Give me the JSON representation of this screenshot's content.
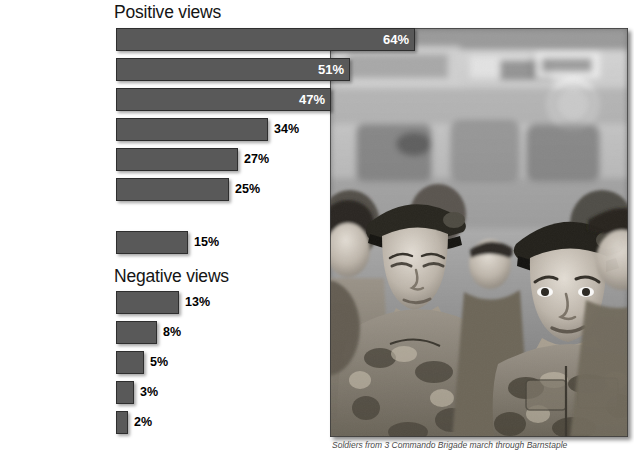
{
  "figure": {
    "background_color": "#ffffff",
    "bar_color": "#595959",
    "bar_border_color": "#2e2e2e",
    "label_color": "#000000",
    "inside_value_color": "#ffffff"
  },
  "sections": {
    "positive_title": "Positive views",
    "negative_title": "Negative views"
  },
  "caption": {
    "text": "Soldiers from 3 Commando Brigade march through Barnstaple"
  },
  "chart_data": {
    "type": "bar",
    "orientation": "horizontal",
    "title": "Positive views",
    "subtitle": "Negative views",
    "xlabel": "",
    "ylabel": "",
    "xlim": [
      0,
      70
    ],
    "grid": false,
    "legend": "none",
    "value_suffix": "%",
    "categories": [
      "Supportive",
      "Proud",
      "Respectful",
      "Sympathetic",
      "Grateful",
      "Admiring",
      "Indifferent",
      "Wary",
      "Intimidated",
      "Condescending",
      "Jealous",
      "Afraid"
    ],
    "values": [
      64,
      51,
      47,
      34,
      27,
      25,
      15,
      13,
      8,
      5,
      3,
      2
    ],
    "groups": [
      {
        "name": "Positive views",
        "categories": [
          "Supportive",
          "Proud",
          "Respectful",
          "Sympathetic",
          "Grateful",
          "Admiring"
        ],
        "values": [
          64,
          51,
          47,
          34,
          27,
          25
        ]
      },
      {
        "name": "Neutral",
        "categories": [
          "Indifferent"
        ],
        "values": [
          15
        ]
      },
      {
        "name": "Negative views",
        "categories": [
          "Wary",
          "Intimidated",
          "Condescending",
          "Jealous",
          "Afraid"
        ],
        "values": [
          13,
          8,
          5,
          3,
          2
        ]
      }
    ]
  },
  "rows": [
    {
      "label": "Supportive",
      "value": 64,
      "value_text": "64%",
      "top": 28,
      "width": 299,
      "value_inside": true
    },
    {
      "label": "Proud",
      "value": 51,
      "value_text": "51%",
      "top": 58,
      "width": 234,
      "value_inside": true
    },
    {
      "label": "Respectful",
      "value": 47,
      "value_text": "47%",
      "top": 88,
      "width": 215,
      "value_inside": true
    },
    {
      "label": "Sympathetic",
      "value": 34,
      "value_text": "34%",
      "top": 118,
      "width": 152,
      "value_inside": false
    },
    {
      "label": "Grateful",
      "value": 27,
      "value_text": "27%",
      "top": 148,
      "width": 122,
      "value_inside": false
    },
    {
      "label": "Admiring",
      "value": 25,
      "value_text": "25%",
      "top": 178,
      "width": 113,
      "value_inside": false
    },
    {
      "label": "Indifferent",
      "value": 15,
      "value_text": "15%",
      "top": 231,
      "width": 72,
      "value_inside": false
    },
    {
      "label": "Wary",
      "value": 13,
      "value_text": "13%",
      "top": 291,
      "width": 63,
      "value_inside": false
    },
    {
      "label": "Intimidated",
      "value": 8,
      "value_text": "8%",
      "top": 321,
      "width": 41,
      "value_inside": false
    },
    {
      "label": "Condescending",
      "value": 5,
      "value_text": "5%",
      "top": 351,
      "width": 28,
      "value_inside": false
    },
    {
      "label": "Jealous",
      "value": 3,
      "value_text": "3%",
      "top": 381,
      "width": 18,
      "value_inside": false
    },
    {
      "label": "Afraid",
      "value": 2,
      "value_text": "2%",
      "top": 411,
      "width": 12,
      "value_inside": false
    }
  ]
}
